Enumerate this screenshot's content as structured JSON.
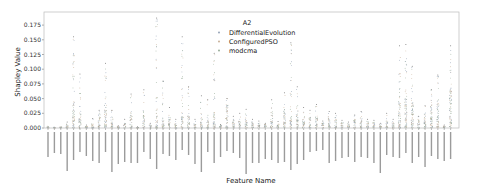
{
  "chart_data": {
    "type": "scatter",
    "subtype": "strip",
    "title": "",
    "xlabel": "Feature Name",
    "ylabel": "Shapley Value",
    "ylim": [
      0.0,
      0.18
    ],
    "yticks": [
      "0.000",
      "0.025",
      "0.050",
      "0.075",
      "0.100",
      "0.125",
      "0.150",
      "0.175"
    ],
    "grid": false,
    "legend": {
      "title": "A2",
      "position": "upper center",
      "entries": [
        {
          "label": "DifferentialEvolution",
          "color": "#8c9bb0"
        },
        {
          "label": "ConfiguredPSO",
          "color": "#c2a88e"
        },
        {
          "label": "modcma",
          "color": "#8fa58f"
        }
      ]
    },
    "x_tick_count": 64,
    "x_tick_labels_note": "64 rotated feature-name labels, illegible at this resolution",
    "series_max_values": [
      0.003,
      0.002,
      0.002,
      0.01,
      0.155,
      0.092,
      0.005,
      0.016,
      0.03,
      0.11,
      0.03,
      0.004,
      0.015,
      0.058,
      0.002,
      0.065,
      0.008,
      0.187,
      0.08,
      0.035,
      0.015,
      0.155,
      0.07,
      0.015,
      0.055,
      0.048,
      0.127,
      0.006,
      0.05,
      0.02,
      0.025,
      0.032,
      0.015,
      0.012,
      0.008,
      0.048,
      0.011,
      0.06,
      0.145,
      0.07,
      0.035,
      0.03,
      0.04,
      0.012,
      0.028,
      0.025,
      0.013,
      0.01,
      0.022,
      0.028,
      0.015,
      0.013,
      0.008,
      0.025,
      0.015,
      0.14,
      0.142,
      0.105,
      0.02,
      0.038,
      0.065,
      0.09,
      0.005,
      0.14
    ],
    "series_density_top": [
      0.003,
      0.002,
      0.002,
      0.008,
      0.045,
      0.03,
      0.004,
      0.01,
      0.025,
      0.04,
      0.02,
      0.003,
      0.008,
      0.022,
      0.001,
      0.022,
      0.006,
      0.02,
      0.018,
      0.015,
      0.008,
      0.02,
      0.022,
      0.008,
      0.016,
      0.014,
      0.03,
      0.005,
      0.04,
      0.014,
      0.012,
      0.015,
      0.01,
      0.009,
      0.007,
      0.028,
      0.008,
      0.03,
      0.02,
      0.03,
      0.02,
      0.018,
      0.022,
      0.01,
      0.02,
      0.018,
      0.01,
      0.008,
      0.015,
      0.02,
      0.012,
      0.01,
      0.007,
      0.012,
      0.01,
      0.05,
      0.055,
      0.052,
      0.015,
      0.025,
      0.048,
      0.048,
      0.004,
      0.07
    ]
  }
}
